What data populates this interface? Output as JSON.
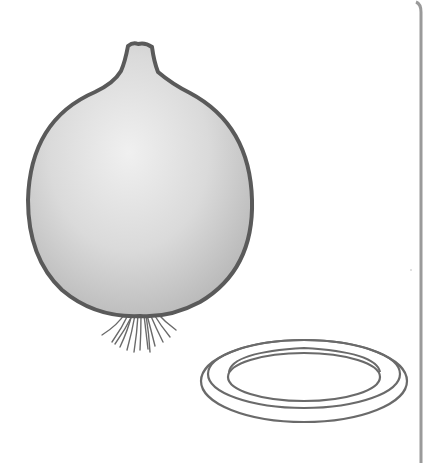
{
  "image": {
    "description": "Grayscale illustration of an onion bulb with roots beside a flat ring, bordered on the right by a vertical gray line",
    "objects": [
      {
        "name": "onion",
        "shape": "round bulb with pointed neck and hair-like roots at the bottom"
      },
      {
        "name": "ring",
        "shape": "flat double-outlined elliptical ring seen in perspective"
      }
    ],
    "colors": {
      "background": "#ffffff",
      "outline": "#5a5a5a",
      "onion_fill_light": "#ececec",
      "onion_fill_dark": "#bdbdbd",
      "ring_stroke": "#6a6a6a",
      "border_line": "#9a9a9a"
    }
  }
}
